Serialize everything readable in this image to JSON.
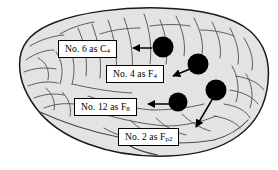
{
  "figure": {
    "type": "brain-electrode-placement-diagram",
    "view": "lateral brain illustration",
    "background_color": "#ffffff",
    "brain_fill_color": "#e3e3e3",
    "brain_outline_color": "#1a1a1a",
    "electrode_color": "#000000",
    "callout_border_color": "#000000",
    "callout_fill_color": "#ffffff"
  },
  "callouts": [
    {
      "id": "c4",
      "prefix": "No. 6 as C",
      "subscript": "4",
      "full_text": "No. 6 as C4",
      "channel_number": "6",
      "electrode_label": "C4"
    },
    {
      "id": "f4",
      "prefix": "No. 4 as F",
      "subscript": "4",
      "full_text": "No. 4 as F4",
      "channel_number": "4",
      "electrode_label": "F4"
    },
    {
      "id": "f8",
      "prefix": "No. 12 as F",
      "subscript": "8",
      "full_text": "No. 12 as F8",
      "channel_number": "12",
      "electrode_label": "F8"
    },
    {
      "id": "fp2",
      "prefix": "No. 2 as F",
      "subscript": "p2",
      "full_text": "No. 2 as Fp2",
      "channel_number": "2",
      "electrode_label": "Fp2"
    }
  ],
  "electrodes": [
    {
      "id": "electrode-c4",
      "cx": 163,
      "cy": 47,
      "r": 10.5
    },
    {
      "id": "electrode-f4",
      "cx": 198,
      "cy": 64,
      "r": 10.5
    },
    {
      "id": "electrode-f8",
      "cx": 178,
      "cy": 102,
      "r": 9.5
    },
    {
      "id": "electrode-fp2",
      "cx": 216,
      "cy": 90,
      "r": 10.5
    }
  ]
}
